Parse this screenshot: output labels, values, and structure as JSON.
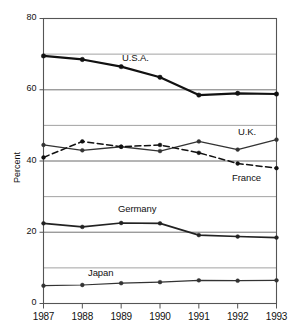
{
  "chart_data": {
    "type": "line",
    "title": "",
    "xlabel": "",
    "ylabel": "Percent",
    "x": [
      1987,
      1988,
      1989,
      1990,
      1991,
      1992,
      1993
    ],
    "xtick_labels": [
      "1987",
      "1988",
      "1989",
      "1990",
      "1991",
      "1992",
      "1993"
    ],
    "ytick_labels": [
      "0",
      "20",
      "40",
      "60",
      "80"
    ],
    "yticks": [
      0,
      20,
      40,
      60,
      80
    ],
    "ylim": [
      0,
      80
    ],
    "xlim": [
      1987,
      1993
    ],
    "gridlines": [
      10,
      20,
      30,
      40,
      50,
      60,
      70
    ],
    "grid": true,
    "legend_position": "inline-labels",
    "series": [
      {
        "name": "U.S.A.",
        "style": "solid",
        "width": 2.2,
        "color": "#111111",
        "values": [
          69.5,
          68.5,
          66.5,
          63.5,
          58.5,
          59.0,
          58.8
        ],
        "label_x": 122,
        "label_y": 52
      },
      {
        "name": "U.K.",
        "style": "solid",
        "width": 1.3,
        "color": "#333333",
        "values": [
          44.5,
          43.0,
          44.0,
          42.8,
          45.5,
          43.2,
          46.0
        ],
        "label_x": 238,
        "label_y": 126
      },
      {
        "name": "France",
        "style": "dashed",
        "width": 1.5,
        "color": "#111111",
        "values": [
          41.0,
          45.5,
          44.0,
          44.5,
          42.3,
          39.3,
          38.0
        ],
        "label_x": 232,
        "label_y": 172
      },
      {
        "name": "Germany",
        "style": "solid",
        "width": 1.7,
        "color": "#222222",
        "values": [
          22.5,
          21.5,
          22.6,
          22.5,
          19.2,
          18.8,
          18.5
        ],
        "label_x": 118,
        "label_y": 203
      },
      {
        "name": "Japan",
        "style": "solid",
        "width": 1.2,
        "color": "#333333",
        "values": [
          5.0,
          5.2,
          5.7,
          6.0,
          6.5,
          6.4,
          6.5
        ],
        "label_x": 88,
        "label_y": 267
      }
    ]
  }
}
